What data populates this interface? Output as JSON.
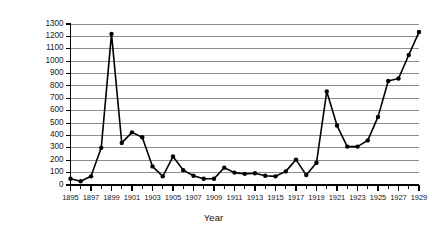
{
  "chart_data": {
    "type": "line",
    "title": "",
    "xlabel": "Year",
    "ylabel": "Frequency",
    "xlim": [
      1895,
      1929
    ],
    "ylim": [
      0,
      1300
    ],
    "ytick_step": 100,
    "xtick_step": 1,
    "xtick_label_step": 2,
    "grid": true,
    "legend": false,
    "marker": "filled-circle",
    "line_color": "#000000",
    "grid_color": "#8c8c8c",
    "axis_color": "#000000",
    "background": "#ffffff",
    "x": [
      1895,
      1896,
      1897,
      1898,
      1899,
      1900,
      1901,
      1902,
      1903,
      1904,
      1905,
      1906,
      1907,
      1908,
      1909,
      1910,
      1911,
      1912,
      1913,
      1914,
      1915,
      1916,
      1917,
      1918,
      1919,
      1920,
      1921,
      1922,
      1923,
      1924,
      1925,
      1926,
      1927,
      1928,
      1929
    ],
    "values": [
      50,
      30,
      70,
      300,
      1220,
      340,
      425,
      385,
      150,
      70,
      230,
      120,
      75,
      50,
      50,
      140,
      100,
      90,
      95,
      75,
      70,
      110,
      205,
      80,
      180,
      755,
      480,
      310,
      310,
      360,
      550,
      840,
      860,
      1050,
      1235
    ],
    "yticks": [
      0,
      100,
      200,
      300,
      400,
      500,
      600,
      700,
      800,
      900,
      1000,
      1100,
      1200,
      1300
    ],
    "ytick_labels": [
      "0",
      "100",
      "200",
      "300",
      "400",
      "500",
      "600",
      "700",
      "800",
      "900",
      "1000",
      "1100",
      "1200",
      "1300"
    ],
    "xtick_labels": [
      "1895",
      "1897",
      "1899",
      "1901",
      "1903",
      "1905",
      "1907",
      "1909",
      "1911",
      "1913",
      "1915",
      "1917",
      "1919",
      "1921",
      "1923",
      "1925",
      "1927",
      "1929"
    ],
    "xtick_label_years": [
      1895,
      1897,
      1899,
      1901,
      1903,
      1905,
      1907,
      1909,
      1911,
      1913,
      1915,
      1917,
      1919,
      1921,
      1923,
      1925,
      1927,
      1929
    ]
  }
}
